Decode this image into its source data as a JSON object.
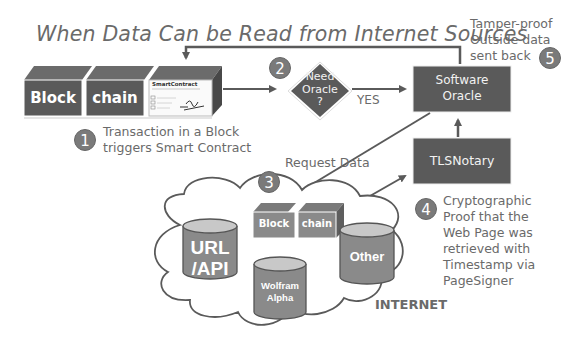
{
  "title": "When Data Can be Read from Internet Sources",
  "blockchain_top": {
    "block_label": "Block",
    "chain_label": "chain",
    "smart_contract_label": "SmartContract"
  },
  "steps": [
    {
      "number": "1",
      "text_lines": [
        "Transaction in a Block",
        "triggers Smart Contract"
      ]
    },
    {
      "number": "2",
      "decision_lines": [
        "Need",
        "Oracle",
        "?"
      ],
      "branch_label": "YES"
    },
    {
      "number": "3",
      "text": "Request Data"
    },
    {
      "number": "4",
      "text_lines": [
        "Cryptographic",
        "Proof that the",
        "Web Page was",
        "retrieved with",
        "Timestamp via",
        "PageSigner"
      ]
    },
    {
      "number": "5",
      "text_lines": [
        "Tamper-proof",
        "Outside data",
        "sent back"
      ]
    }
  ],
  "software_oracle": {
    "lines": [
      "Software",
      "Oracle"
    ]
  },
  "tlsnotary": {
    "label": "TLSNotary"
  },
  "internet": {
    "label": "INTERNET",
    "blockchain": {
      "block_label": "Block",
      "chain_label": "chain"
    },
    "databases": [
      {
        "lines": [
          "URL",
          "/API"
        ]
      },
      {
        "lines": [
          "Wolfram",
          "Alpha"
        ]
      },
      {
        "lines": [
          "Other"
        ]
      }
    ]
  },
  "colors": {
    "dark_box": "#5a5a5a",
    "block_top": "#6b6b6b",
    "block_side": "#484848",
    "db_body": "#8a8a8a",
    "db_top": "#c8c8c8",
    "arrow": "#5a5a5a",
    "step_circle": "#7a7a7a",
    "text": "#6a6a6a"
  }
}
